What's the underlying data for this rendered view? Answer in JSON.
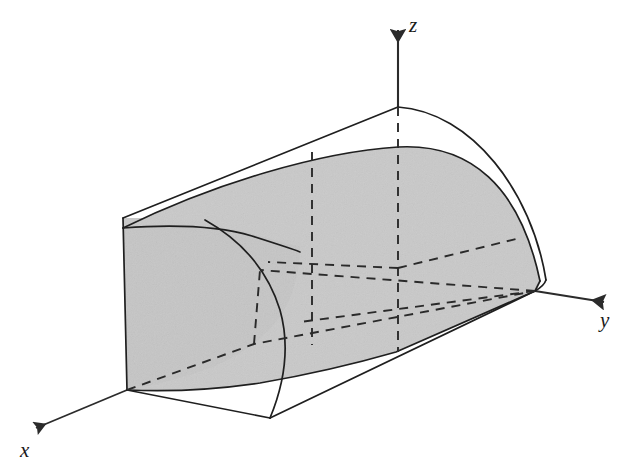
{
  "figure": {
    "kind": "3d-solid-region-diagram",
    "background_color": "#ffffff",
    "stroke_color": "#1a1a1a",
    "shaded_face_color": "#c9c9c9",
    "shaded_face_color_dark": "#bdbdbd",
    "unshaded_face_color": "#ffffff",
    "dashed_color": "#2a2a2a"
  },
  "axes": {
    "items": [
      {
        "id": "z",
        "label": "z",
        "direction": "up",
        "label_x": 409,
        "label_y": 32,
        "arrow_tip_x": 398,
        "arrow_tip_y": 22,
        "origin_x": 398,
        "origin_y": 107
      },
      {
        "id": "y",
        "label": "y",
        "direction": "right-down",
        "label_x": 600,
        "label_y": 325,
        "arrow_tip_x": 613,
        "arrow_tip_y": 303,
        "origin_x": 535,
        "origin_y": 291
      },
      {
        "id": "x",
        "label": "x",
        "direction": "left-down",
        "label_x": 22,
        "label_y": 456,
        "arrow_tip_x": 26,
        "arrow_tip_y": 432,
        "origin_x": 127,
        "origin_y": 390
      }
    ]
  },
  "vertices": {
    "origin": {
      "x": 535,
      "y": 291
    },
    "z_apex": {
      "x": 398,
      "y": 107
    },
    "front_top_left": {
      "x": 123,
      "y": 218
    },
    "front_bottom_left": {
      "x": 127,
      "y": 390
    },
    "bottom_front_vertex": {
      "x": 270,
      "y": 418
    },
    "surface_top_mid": {
      "x": 398,
      "y": 147
    },
    "surface_left_mid": {
      "x": 123,
      "y": 228
    },
    "right_curve_foot": {
      "x": 540,
      "y": 281
    },
    "shade_bottom_right": {
      "x": 535,
      "y": 291
    }
  },
  "guides": {
    "vertical_dashed": [
      {
        "name": "dashed-vertical-inner",
        "x": 312,
        "y_top": 152,
        "y_bottom": 345
      },
      {
        "name": "dashed-vertical-axis",
        "x": 398,
        "y_top": 107,
        "y_bottom": 352
      }
    ],
    "radial_dashed_count": 4,
    "hidden_base_dashed": true
  },
  "curves": {
    "outer_arc_name": "outer-boundary-arc",
    "inner_arc_name": "surface-boundary-arc",
    "left_face_arc_name": "left-face-arc",
    "front_cut_arc_name": "front-cut-arc"
  }
}
